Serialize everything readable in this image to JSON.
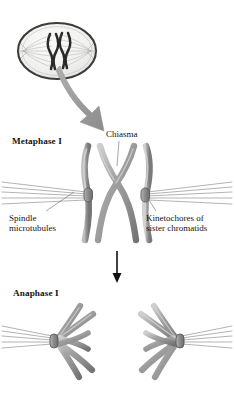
{
  "figure": {
    "background_color": "#ffffff",
    "chromosome_color": "#8f8f8f",
    "chromosome_highlight": "#c9c9c9",
    "chromosome_outline": "#4a4a4a",
    "spindle_color": "#a8a8a8",
    "arrow_gray": "#9a9a9a",
    "arrow_black": "#111111",
    "cell_border_color": "#3c3c3c",
    "cell_fill_color": "#f2f2f0"
  },
  "labels": {
    "metaphase": "Metaphase I",
    "chiasma": "Chiasma",
    "spindle_line1": "Spindle",
    "spindle_line2": "microtubules",
    "kinetochores_line1": "Kinetochores of",
    "kinetochores_line2": "sister chromatids",
    "anaphase": "Anaphase I"
  },
  "panels": [
    {
      "name": "cell-overview",
      "label": "",
      "description": "Oval cell at metaphase I with spindle and aligned bivalents"
    },
    {
      "name": "metaphase-detail",
      "label": "Metaphase I",
      "description": "Tetrad of two homologous chromosomes with chiasma, kinetochores and spindle microtubules"
    },
    {
      "name": "anaphase-detail",
      "label": "Anaphase I",
      "description": "Homologous chromosomes separating toward opposite poles"
    }
  ],
  "structures": [
    "chiasma",
    "spindle microtubules",
    "kinetochores of sister chromatids"
  ]
}
